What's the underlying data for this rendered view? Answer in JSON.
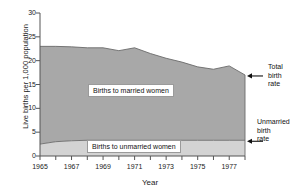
{
  "chart_data": {
    "type": "area",
    "stacked": true,
    "title": "",
    "xlabel": "Year",
    "ylabel": "Live births per 1,000 population",
    "xlim": [
      1965,
      1978
    ],
    "ylim": [
      0,
      30
    ],
    "yticks": [
      0,
      5,
      10,
      15,
      20,
      25,
      30
    ],
    "ytick_labels": [
      "0",
      "5",
      "10",
      "15",
      "20",
      "25",
      "30"
    ],
    "xticks": [
      1965,
      1966,
      1967,
      1968,
      1969,
      1970,
      1971,
      1972,
      1973,
      1974,
      1975,
      1976,
      1977,
      1978
    ],
    "xtick_labels": [
      "1965",
      "",
      "1967",
      "",
      "1969",
      "",
      "1971",
      "",
      "1973",
      "",
      "1975",
      "",
      "1977",
      ""
    ],
    "grid": false,
    "legend_position": "inline-labels",
    "x": [
      1965,
      1966,
      1967,
      1968,
      1969,
      1970,
      1971,
      1972,
      1973,
      1974,
      1975,
      1976,
      1977,
      1978
    ],
    "series": [
      {
        "name": "Births to unmarried women",
        "color": "#d3d3d3",
        "values": [
          2.5,
          3.0,
          3.2,
          3.3,
          3.3,
          3.3,
          3.3,
          3.3,
          3.3,
          3.3,
          3.3,
          3.3,
          3.3,
          3.3
        ]
      },
      {
        "name": "Births to married women",
        "color": "#a8a8a8",
        "values": [
          20.5,
          20.0,
          19.7,
          19.4,
          19.4,
          18.8,
          19.4,
          18.2,
          17.2,
          16.4,
          15.4,
          14.9,
          15.6,
          13.7
        ]
      }
    ],
    "total_line": {
      "name": "Total birth rate",
      "values": [
        23.0,
        23.0,
        22.9,
        22.7,
        22.7,
        22.1,
        22.7,
        21.5,
        20.5,
        19.7,
        18.7,
        18.2,
        18.9,
        17.0
      ]
    },
    "unmarried_line": {
      "name": "Unmarried birth rate",
      "values": [
        2.5,
        3.0,
        3.2,
        3.3,
        3.3,
        3.3,
        3.3,
        3.3,
        3.3,
        3.3,
        3.3,
        3.3,
        3.3,
        3.3
      ]
    },
    "annotations": [
      {
        "name": "total-birth-rate",
        "lines": [
          "Total",
          "birth",
          "rate"
        ],
        "points_to": "top-edge"
      },
      {
        "name": "unmarried-birth-rate",
        "lines": [
          "Unmarried",
          "birth",
          "rate"
        ],
        "points_to": "lower-edge"
      }
    ],
    "inline_labels": [
      {
        "name": "births-to-married-women",
        "text": "Births to married women"
      },
      {
        "name": "births-to-unmarried-women",
        "text": "Births to unmarried women"
      }
    ],
    "colors": {
      "married_fill": "#a8a8a8",
      "unmarried_fill": "#d3d3d3",
      "axis": "#555555",
      "line": "#6b6b6b",
      "text": "#1a1a1a",
      "background": "#ffffff"
    }
  },
  "axes": {
    "ylabel": "Live births per 1,000 population",
    "xlabel": "Year",
    "yticks": [
      "0",
      "5",
      "10",
      "15",
      "20",
      "25",
      "30"
    ],
    "xticks": [
      "1965",
      "1967",
      "1969",
      "1971",
      "1973",
      "1975",
      "1977"
    ]
  },
  "labels": {
    "married": "Births to married women",
    "unmarried": "Births to unmarried women"
  },
  "annotations": {
    "total": {
      "line1": "Total",
      "line2": "birth",
      "line3": "rate"
    },
    "unmarried": {
      "line1": "Unmarried",
      "line2": "birth",
      "line3": "rate"
    }
  }
}
